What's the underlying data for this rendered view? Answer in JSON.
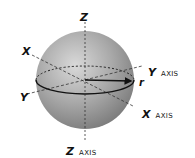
{
  "diagram": {
    "type": "3d sphere with coordinate axes",
    "labels": {
      "z_top": "Z",
      "x_left": "X",
      "y_left": "Y",
      "y_axis": {
        "letter": "Y",
        "word": "AXIS"
      },
      "x_axis": {
        "letter": "X",
        "word": "AXIS"
      },
      "z_axis": {
        "letter": "Z",
        "word": "AXIS"
      },
      "radius": "r"
    },
    "colors": {
      "sphere_light": "#d6d6d6",
      "sphere_mid": "#a9a9a9",
      "sphere_dark": "#7e7e7e",
      "lines": "#222222"
    }
  }
}
